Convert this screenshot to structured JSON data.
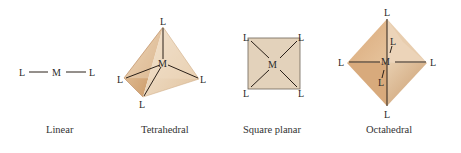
{
  "colors": {
    "shape_fill_light": "#eedcc4",
    "shape_fill_mid": "#dcb48c",
    "shape_fill_dark": "#c99866",
    "square_fill": "#e3d2bb",
    "bond_color": "#2a2018"
  },
  "geometries": [
    {
      "id": "linear",
      "caption": "Linear",
      "center_label": "M",
      "ligand_label": "L",
      "ligand_count": 2
    },
    {
      "id": "tetrahedral",
      "caption": "Tetrahedral",
      "center_label": "M",
      "ligand_label": "L",
      "ligand_count": 4
    },
    {
      "id": "square-planar",
      "caption": "Square planar",
      "center_label": "M",
      "ligand_label": "L",
      "ligand_count": 4
    },
    {
      "id": "octahedral",
      "caption": "Octahedral",
      "center_label": "M",
      "ligand_label": "L",
      "ligand_count": 6
    }
  ]
}
